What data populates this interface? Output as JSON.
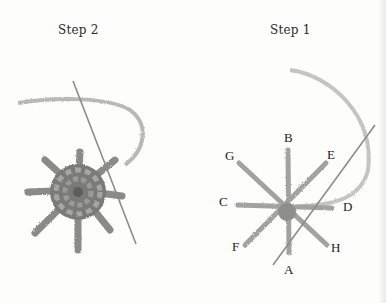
{
  "figures": [
    {
      "caption": "Step 2",
      "description": "Completed woven spider web stitch with needle and yarn"
    },
    {
      "caption": "Step 1",
      "description": "Straight-stitch spokes with needle and yarn",
      "point_labels": [
        "A",
        "B",
        "C",
        "D",
        "E",
        "F",
        "G",
        "H"
      ]
    }
  ]
}
